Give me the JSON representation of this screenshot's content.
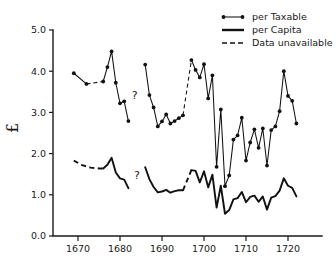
{
  "chart_data": {
    "type": "line",
    "title": "",
    "xlabel": "",
    "ylabel": "£",
    "xlim": [
      1666,
      1724
    ],
    "ylim": [
      0.0,
      5.0
    ],
    "grid": false,
    "legend_position": "top-right",
    "xticks": [
      1670,
      1680,
      1690,
      1700,
      1710,
      1720
    ],
    "yticks": [
      "0.0",
      "1.0",
      "2.0",
      "3.0",
      "4.0",
      "5.0"
    ],
    "annotations": [
      {
        "text": "?",
        "x": 1683.5,
        "y": 3.32
      },
      {
        "text": "?",
        "x": 1684.0,
        "y": 1.38
      }
    ],
    "legend": [
      {
        "label": "per Taxable",
        "style": "line-markers"
      },
      {
        "label": "per Capita",
        "style": "solid-thick"
      },
      {
        "label": "Data unavailable",
        "style": "dashed"
      }
    ],
    "series": [
      {
        "name": "per Taxable",
        "style": "line-markers",
        "segments": [
          {
            "gap": false,
            "points": [
              [
                1669,
                3.95
              ],
              [
                1672,
                3.69
              ]
            ]
          },
          {
            "gap": true,
            "points": [
              [
                1672,
                3.69
              ],
              [
                1676,
                3.75
              ]
            ]
          },
          {
            "gap": false,
            "points": [
              [
                1676,
                3.75
              ],
              [
                1677,
                4.1
              ],
              [
                1678,
                4.48
              ],
              [
                1679,
                3.72
              ],
              [
                1680,
                3.22
              ],
              [
                1681,
                3.27
              ],
              [
                1682,
                2.79
              ]
            ]
          },
          {
            "gap": false,
            "points": [
              [
                1686,
                4.16
              ],
              [
                1687,
                3.42
              ],
              [
                1688,
                3.12
              ],
              [
                1689,
                2.66
              ],
              [
                1690,
                2.78
              ],
              [
                1691,
                2.95
              ],
              [
                1692,
                2.73
              ],
              [
                1693,
                2.79
              ],
              [
                1694,
                2.86
              ],
              [
                1695,
                2.93
              ]
            ]
          },
          {
            "gap": true,
            "points": [
              [
                1695,
                2.93
              ],
              [
                1697,
                4.27
              ]
            ]
          },
          {
            "gap": false,
            "points": [
              [
                1697,
                4.27
              ],
              [
                1698,
                4.03
              ],
              [
                1699,
                3.85
              ],
              [
                1700,
                4.17
              ],
              [
                1701,
                3.34
              ],
              [
                1702,
                3.9
              ],
              [
                1703,
                1.68
              ],
              [
                1704,
                3.07
              ],
              [
                1705,
                1.21
              ],
              [
                1706,
                1.47
              ],
              [
                1707,
                2.34
              ],
              [
                1708,
                2.44
              ],
              [
                1709,
                2.87
              ],
              [
                1710,
                1.83
              ],
              [
                1711,
                2.27
              ],
              [
                1712,
                2.59
              ],
              [
                1713,
                2.14
              ],
              [
                1714,
                2.61
              ],
              [
                1715,
                1.71
              ],
              [
                1716,
                2.57
              ],
              [
                1717,
                2.66
              ],
              [
                1718,
                3.03
              ],
              [
                1719,
                4.0
              ],
              [
                1720,
                3.4
              ],
              [
                1721,
                3.28
              ],
              [
                1722,
                2.73
              ]
            ]
          }
        ]
      },
      {
        "name": "per Capita",
        "style": "solid-thick",
        "segments": [
          {
            "gap": true,
            "points": [
              [
                1669,
                1.83
              ],
              [
                1671,
                1.72
              ],
              [
                1673,
                1.66
              ],
              [
                1675,
                1.64
              ],
              [
                1676,
                1.64
              ]
            ]
          },
          {
            "gap": false,
            "points": [
              [
                1676,
                1.64
              ],
              [
                1677,
                1.73
              ],
              [
                1678,
                1.9
              ],
              [
                1679,
                1.54
              ],
              [
                1680,
                1.4
              ],
              [
                1681,
                1.37
              ],
              [
                1682,
                1.16
              ]
            ]
          },
          {
            "gap": false,
            "points": [
              [
                1686,
                1.67
              ],
              [
                1687,
                1.38
              ],
              [
                1688,
                1.19
              ],
              [
                1689,
                1.06
              ],
              [
                1690,
                1.08
              ],
              [
                1691,
                1.12
              ],
              [
                1692,
                1.05
              ],
              [
                1693,
                1.09
              ],
              [
                1694,
                1.11
              ],
              [
                1695,
                1.11
              ]
            ]
          },
          {
            "gap": true,
            "points": [
              [
                1695,
                1.11
              ],
              [
                1697,
                1.6
              ]
            ]
          },
          {
            "gap": false,
            "points": [
              [
                1697,
                1.6
              ],
              [
                1698,
                1.58
              ],
              [
                1699,
                1.3
              ],
              [
                1700,
                1.57
              ],
              [
                1701,
                1.18
              ],
              [
                1702,
                1.49
              ],
              [
                1703,
                0.69
              ],
              [
                1704,
                1.22
              ],
              [
                1705,
                0.54
              ],
              [
                1706,
                0.63
              ],
              [
                1707,
                0.89
              ],
              [
                1708,
                0.92
              ],
              [
                1709,
                1.07
              ],
              [
                1710,
                0.82
              ],
              [
                1711,
                0.95
              ],
              [
                1712,
                0.98
              ],
              [
                1713,
                0.83
              ],
              [
                1714,
                0.96
              ],
              [
                1715,
                0.64
              ],
              [
                1716,
                0.93
              ],
              [
                1717,
                0.97
              ],
              [
                1718,
                1.1
              ],
              [
                1719,
                1.4
              ],
              [
                1720,
                1.22
              ],
              [
                1721,
                1.17
              ],
              [
                1722,
                0.96
              ]
            ]
          }
        ]
      }
    ]
  }
}
